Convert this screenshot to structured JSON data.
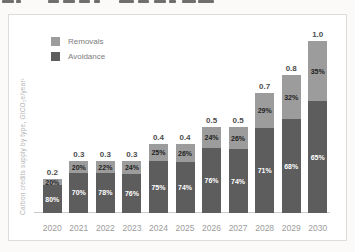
{
  "page": {
    "top_fragments": [
      {
        "x": 2,
        "w": 12
      },
      {
        "x": 16,
        "w": 5
      },
      {
        "x": 48,
        "w": 11
      },
      {
        "x": 63,
        "w": 12
      },
      {
        "x": 79,
        "w": 11
      },
      {
        "x": 94,
        "w": 6
      },
      {
        "x": 119,
        "w": 15
      },
      {
        "x": 138,
        "w": 11
      },
      {
        "x": 154,
        "w": 12
      },
      {
        "x": 169,
        "w": 7
      },
      {
        "x": 182,
        "w": 14
      },
      {
        "x": 198,
        "w": 16
      }
    ]
  },
  "chart": {
    "y_axis_label": "Carbon credits supply by type, GtCO₂e/year¹"
  },
  "chart_data": {
    "type": "bar",
    "stacked": true,
    "title": "",
    "xlabel": "",
    "ylabel": "Carbon credits supply by type, GtCO₂e/year¹",
    "categories": [
      "2020",
      "2021",
      "2022",
      "2023",
      "2024",
      "2025",
      "2026",
      "2027",
      "2028",
      "2029",
      "2030"
    ],
    "totals": [
      0.2,
      0.3,
      0.3,
      0.3,
      0.4,
      0.4,
      0.5,
      0.5,
      0.7,
      0.8,
      1.0
    ],
    "total_labels": [
      "0.2",
      "0.3",
      "0.3",
      "0.3",
      "0.4",
      "0.4",
      "0.5",
      "0.5",
      "0.7",
      "0.8",
      "1.0"
    ],
    "series": [
      {
        "name": "Removals",
        "pct": [
          20,
          20,
          22,
          24,
          25,
          26,
          24,
          26,
          29,
          32,
          35
        ],
        "pct_labels": [
          "20%",
          "20%",
          "22%",
          "24%",
          "25%",
          "26%",
          "24%",
          "26%",
          "29%",
          "32%",
          "35%"
        ],
        "color": "#9c9c9c",
        "label_color": "#222222"
      },
      {
        "name": "Avoidance",
        "pct": [
          80,
          70,
          78,
          76,
          75,
          74,
          76,
          74,
          71,
          68,
          65
        ],
        "pct_labels": [
          "80%",
          "70%",
          "78%",
          "76%",
          "75%",
          "74%",
          "76%",
          "74%",
          "71%",
          "68%",
          "65%"
        ],
        "color": "#5d5d5d",
        "label_color": "#ffffff"
      }
    ],
    "ylim": [
      0,
      1.0
    ],
    "grid": false,
    "legend_position": "top-left"
  }
}
